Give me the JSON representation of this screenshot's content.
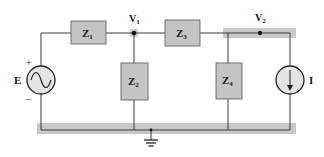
{
  "diagram": {
    "type": "circuit-schematic",
    "colors": {
      "wire": "#3a3a3a",
      "component_fill": "#c4c4c4",
      "component_stroke": "#555555",
      "highlight": "#c8c8c8",
      "source_fill": "#e4e4e4",
      "text": "#1a1a1a"
    },
    "nodes": [
      {
        "id": "V1",
        "label": "V",
        "subscript": "1"
      },
      {
        "id": "V2",
        "label": "V",
        "subscript": "2"
      },
      {
        "id": "ground",
        "label": "ground"
      }
    ],
    "components": [
      {
        "id": "Z1",
        "label": "Z",
        "subscript": "1",
        "kind": "impedance",
        "between": [
          "E+",
          "V1"
        ]
      },
      {
        "id": "Z2",
        "label": "Z",
        "subscript": "2",
        "kind": "impedance",
        "between": [
          "V1",
          "ground"
        ]
      },
      {
        "id": "Z3",
        "label": "Z",
        "subscript": "3",
        "kind": "impedance",
        "between": [
          "V1",
          "V2"
        ]
      },
      {
        "id": "Z4",
        "label": "Z",
        "subscript": "4",
        "kind": "impedance",
        "between": [
          "V2",
          "ground"
        ]
      },
      {
        "id": "E",
        "label": "E",
        "kind": "ac-voltage-source",
        "plus": "+",
        "minus": "–"
      },
      {
        "id": "I",
        "label": "I",
        "kind": "current-source",
        "direction": "down"
      }
    ]
  }
}
